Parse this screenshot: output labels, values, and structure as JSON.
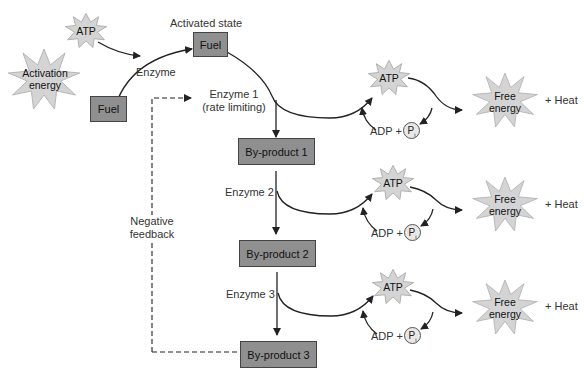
{
  "diagram": {
    "activation": {
      "atp_label": "ATP",
      "activation_energy_line1": "Activation",
      "activation_energy_line2": "energy",
      "enzyme_label": "Enzyme",
      "activated_state_label": "Activated state",
      "fuel_start_label": "Fuel",
      "fuel_activated_label": "Fuel"
    },
    "enzyme1_line1": "Enzyme 1",
    "enzyme1_line2": "(rate limiting)",
    "enzyme2_label": "Enzyme 2",
    "enzyme3_label": "Enzyme 3",
    "negative_feedback_line1": "Negative",
    "negative_feedback_line2": "feedback",
    "products": [
      {
        "label": "By-product 1"
      },
      {
        "label": "By-product 2"
      },
      {
        "label": "By-product 3"
      }
    ],
    "atp_cycles": [
      {
        "atp": "ATP",
        "adp": "ADP +",
        "pi": "P",
        "pi_sub": "i",
        "free1": "Free",
        "free2": "energy",
        "heat": "+ Heat"
      },
      {
        "atp": "ATP",
        "adp": "ADP +",
        "pi": "P",
        "pi_sub": "i",
        "free1": "Free",
        "free2": "energy",
        "heat": "+ Heat"
      },
      {
        "atp": "ATP",
        "adp": "ADP +",
        "pi": "P",
        "pi_sub": "i",
        "free1": "Free",
        "free2": "energy",
        "heat": "+ Heat"
      }
    ],
    "colors": {
      "box_fill": "#8f8f8f",
      "burst_fill": "#d4d4d4",
      "line": "#222222"
    }
  }
}
